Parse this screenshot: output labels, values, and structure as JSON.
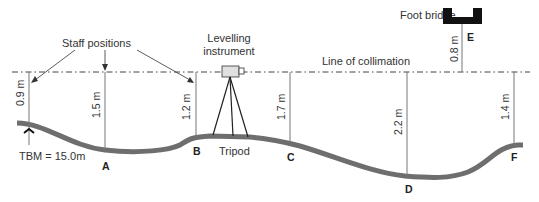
{
  "diagram": {
    "labels": {
      "staff_positions": "Staff positions",
      "levelling_instrument_line1": "Levelling",
      "levelling_instrument_line2": "instrument",
      "line_of_collimation": "Line of collimation",
      "foot_bridge": "Foot bridge",
      "tripod": "Tripod",
      "tbm": "TBM = 15.0m"
    },
    "points": {
      "A": "A",
      "B": "B",
      "C": "C",
      "D": "D",
      "E": "E",
      "F": "F"
    },
    "staff_readings": {
      "tbm": "0.9 m",
      "A": "1.5 m",
      "B": "1.2 m",
      "C": "1.7 m",
      "D": "2.2 m",
      "E": "0.8 m",
      "F": "1.4 m"
    },
    "colors": {
      "ground": "#6e6e6e",
      "lines": "#555555",
      "bridge": "#111111",
      "instrument_fill": "#e0e0e0"
    }
  }
}
